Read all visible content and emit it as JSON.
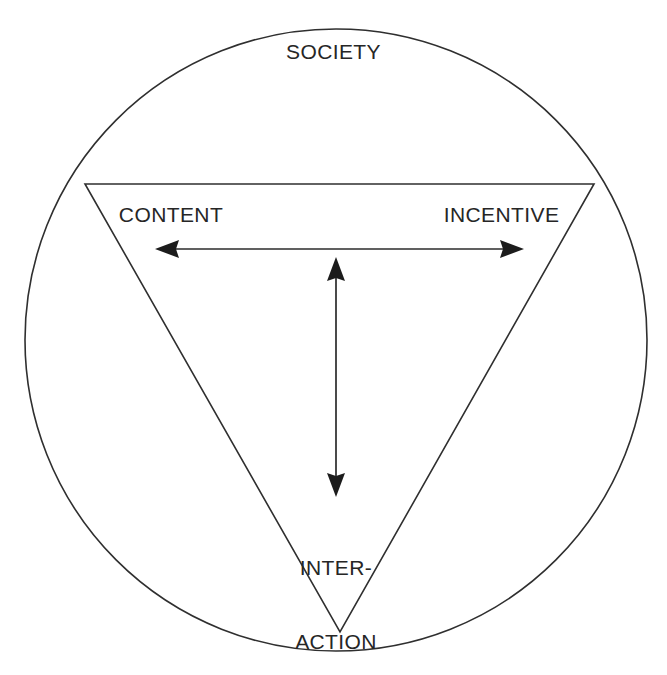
{
  "diagram": {
    "type": "venn-triangle-society-model",
    "background_color": "#ffffff",
    "stroke_color": "#2f2f2f",
    "text_color": "#262626",
    "labels": {
      "outer_circle": "SOCIETY",
      "triangle_vertex_top_left": "CONTENT",
      "triangle_vertex_top_right": "INCENTIVE",
      "triangle_vertex_bottom_line1": "INTER-",
      "triangle_vertex_bottom_line2": "ACTION"
    },
    "shapes": {
      "circle": {
        "cx": 336,
        "cy": 340,
        "r": 311
      },
      "triangle": {
        "points": "85,184 594,184 340,632",
        "orientation": "inverted"
      }
    },
    "arrows": [
      {
        "name": "content-incentive-arrow",
        "orientation": "horizontal",
        "double_headed": true,
        "from": {
          "x": 155,
          "y": 249
        },
        "to": {
          "x": 524,
          "y": 249
        }
      },
      {
        "name": "content-incentive-interaction-arrow",
        "orientation": "vertical",
        "double_headed": true,
        "from": {
          "x": 336,
          "y": 257
        },
        "to": {
          "x": 336,
          "y": 497
        }
      }
    ]
  }
}
